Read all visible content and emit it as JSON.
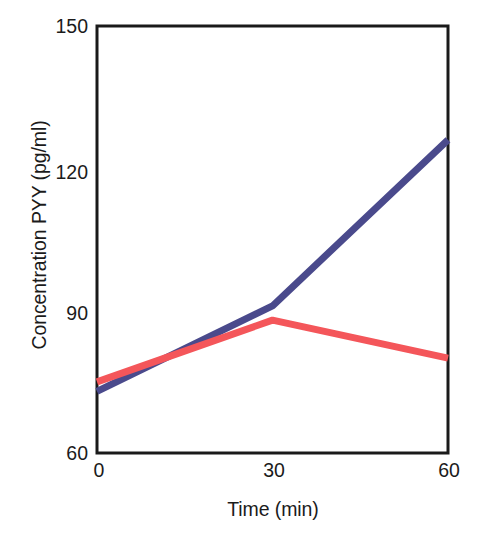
{
  "chart_data": {
    "type": "line",
    "title": "",
    "subtitle": "",
    "xlabel": "Time (min)",
    "ylabel": "Concentration PYY (pg/ml)",
    "x": [
      0,
      30,
      60
    ],
    "xticks": [
      "0",
      "30",
      "60"
    ],
    "yticks": [
      "60",
      "90",
      "120",
      "150"
    ],
    "xlim": [
      0,
      60
    ],
    "ylim": [
      60,
      150
    ],
    "grid": false,
    "legend": "none",
    "axis_box": "left-bottom-top-right",
    "series": [
      {
        "name": "blue-series",
        "color": "#4a4a8c",
        "values": [
          73,
          91,
          126
        ]
      },
      {
        "name": "red-series",
        "color": "#f4565a",
        "values": [
          75,
          88,
          80
        ]
      }
    ]
  },
  "axes": {
    "y_title": "Concentration PYY (pg/ml)",
    "x_title": "Time (min)",
    "y_tick_labels": [
      "150",
      "120",
      "90",
      "60"
    ],
    "x_tick_labels": [
      "0",
      "30",
      "60"
    ]
  },
  "colors": {
    "blue": "#4a4a8c",
    "red": "#f4565a",
    "axis": "#1a1a1a",
    "background": "#ffffff"
  }
}
